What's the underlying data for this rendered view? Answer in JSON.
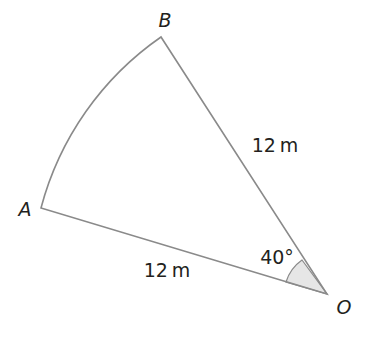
{
  "diagram": {
    "type": "sector",
    "points": {
      "A": {
        "label": "A",
        "x": 41,
        "y": 208
      },
      "B": {
        "label": "B",
        "x": 161,
        "y": 37
      },
      "O": {
        "label": "O",
        "x": 327,
        "y": 294
      }
    },
    "labels": {
      "radius_OB": "12 m",
      "radius_OA": "12 m",
      "angle_O": "40°"
    },
    "colors": {
      "line": "#8a8a8a",
      "angle_fill": "#e6e6e6",
      "text": "#231f20"
    }
  }
}
